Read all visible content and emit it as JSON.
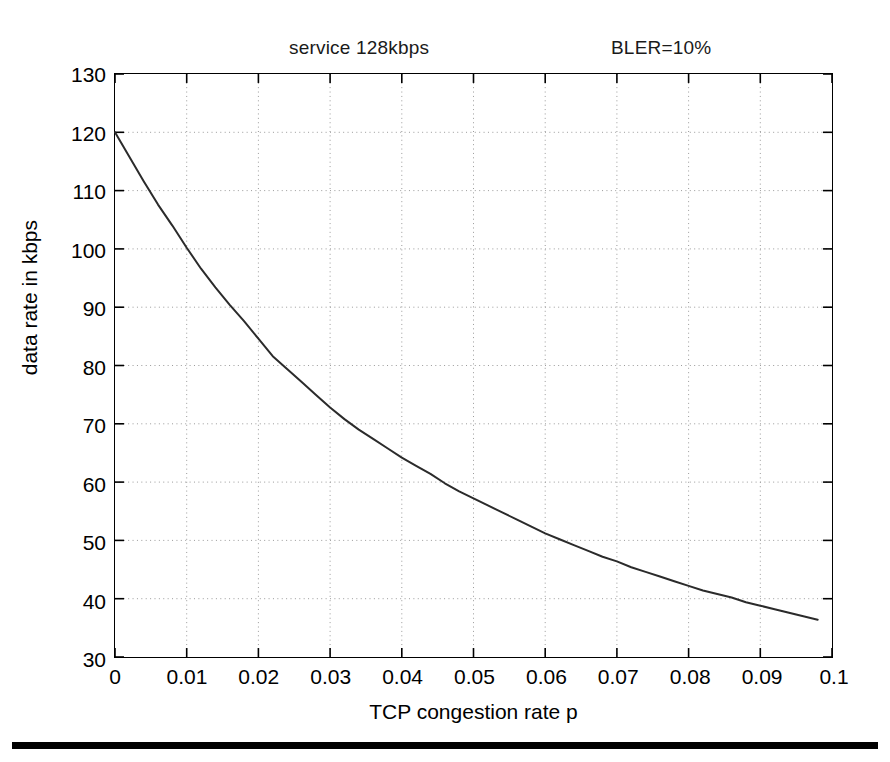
{
  "figure": {
    "annotations": {
      "service": "service 128kbps",
      "bler": "BLER=10%"
    },
    "xlabel": "TCP congestion rate p",
    "ylabel": "data rate in kbps"
  },
  "chart_data": {
    "type": "line",
    "title": "service 128kbps",
    "subtitle": "BLER=10%",
    "xlabel": "TCP congestion rate p",
    "ylabel": "data rate in kbps",
    "xlim": [
      0,
      0.1
    ],
    "ylim": [
      30,
      130
    ],
    "xticks": [
      0,
      0.01,
      0.02,
      0.03,
      0.04,
      0.05,
      0.06,
      0.07,
      0.08,
      0.09,
      0.1
    ],
    "xtick_labels": [
      "0",
      "0.01",
      "0.02",
      "0.03",
      "0.04",
      "0.05",
      "0.06",
      "0.07",
      "0.08",
      "0.09",
      "0.1"
    ],
    "yticks": [
      30,
      40,
      50,
      60,
      70,
      80,
      90,
      100,
      110,
      120,
      130
    ],
    "ytick_labels": [
      "30",
      "40",
      "50",
      "60",
      "70",
      "80",
      "90",
      "100",
      "110",
      "120",
      "130"
    ],
    "grid": true,
    "grid_style": "dotted",
    "legend": null,
    "line_color": "#2b2b2b",
    "line_width": 2,
    "series": [
      {
        "name": "data rate",
        "x": [
          0.0,
          0.002,
          0.004,
          0.006,
          0.008,
          0.01,
          0.012,
          0.014,
          0.016,
          0.018,
          0.02,
          0.022,
          0.024,
          0.026,
          0.028,
          0.03,
          0.032,
          0.034,
          0.036,
          0.038,
          0.04,
          0.042,
          0.044,
          0.046,
          0.048,
          0.05,
          0.052,
          0.054,
          0.056,
          0.058,
          0.06,
          0.062,
          0.064,
          0.066,
          0.068,
          0.07,
          0.072,
          0.074,
          0.076,
          0.078,
          0.08,
          0.082,
          0.084,
          0.086,
          0.088,
          0.09,
          0.092,
          0.094,
          0.096,
          0.098
        ],
        "y": [
          120.0,
          115.8,
          111.6,
          107.6,
          104.0,
          100.2,
          96.6,
          93.4,
          90.4,
          87.6,
          84.6,
          81.6,
          79.4,
          77.2,
          75.0,
          72.8,
          70.8,
          69.0,
          67.4,
          65.8,
          64.2,
          62.8,
          61.4,
          59.8,
          58.4,
          57.2,
          56.0,
          54.8,
          53.6,
          52.4,
          51.2,
          50.2,
          49.2,
          48.2,
          47.2,
          46.4,
          45.4,
          44.6,
          43.8,
          43.0,
          42.2,
          41.4,
          40.8,
          40.2,
          39.4,
          38.8,
          38.2,
          37.6,
          37.0,
          36.4
        ]
      }
    ]
  }
}
